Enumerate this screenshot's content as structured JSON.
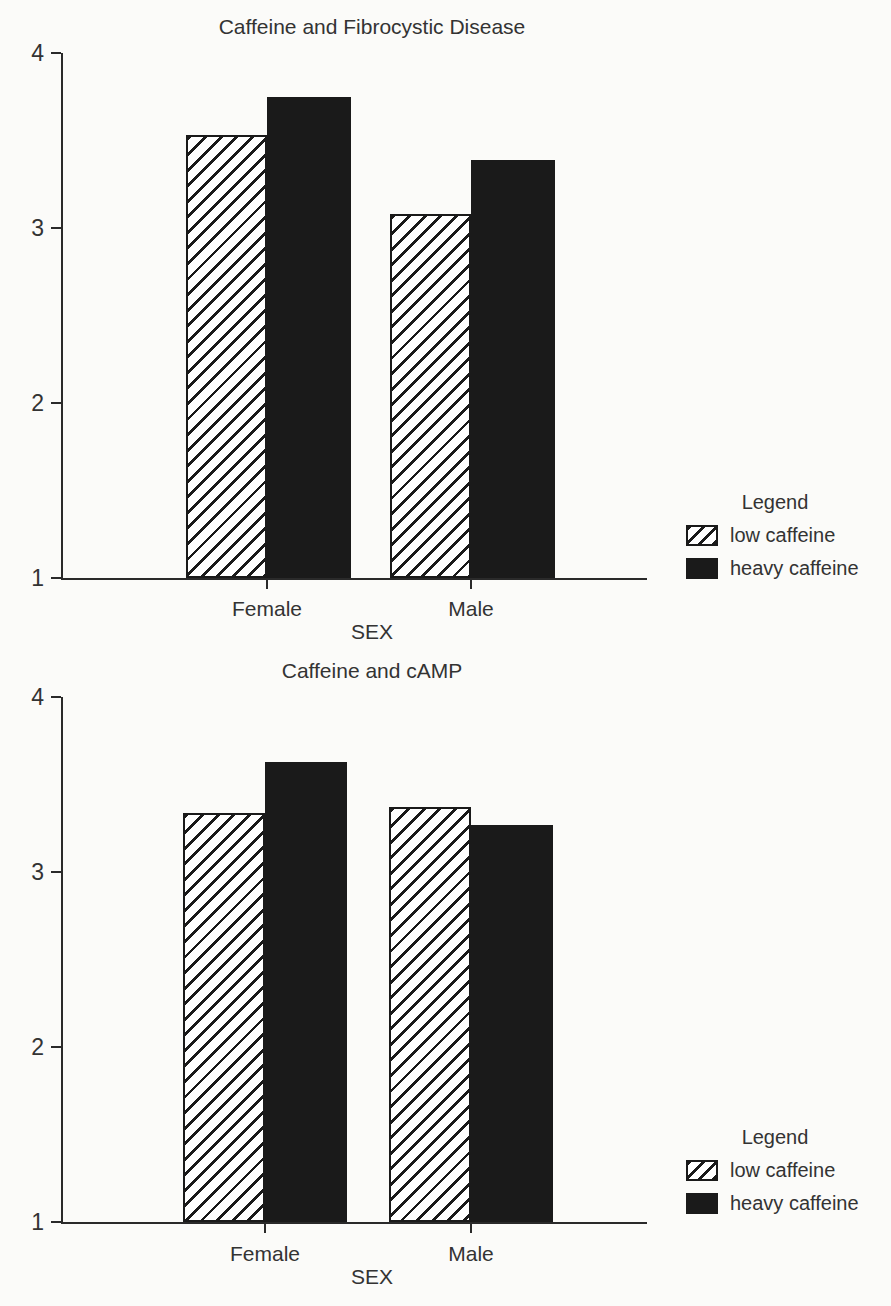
{
  "colors": {
    "background": "#fbfbf9",
    "ink": "#333333",
    "axis": "#2a2a2a",
    "bar_fill": "#1a1a1a",
    "hatch_stripe": "#1a1a1a",
    "hatch_background": "#ffffff"
  },
  "chart_data": [
    {
      "type": "bar",
      "title": "Caffeine and Fibrocystic Disease",
      "categories": [
        "Female",
        "Male"
      ],
      "series": [
        {
          "name": "low caffeine",
          "style": "hatched",
          "values": [
            3.53,
            3.08
          ]
        },
        {
          "name": "heavy caffeine",
          "style": "solid",
          "values": [
            3.75,
            3.39
          ]
        }
      ],
      "xlabel": "SEX",
      "ylabel": "",
      "ylim": [
        1,
        4
      ],
      "yticks": [
        1,
        2,
        3,
        4
      ],
      "grid": false,
      "legend_title": "Legend",
      "legend_position": "right"
    },
    {
      "type": "bar",
      "title": "Caffeine and cAMP",
      "categories": [
        "Female",
        "Male"
      ],
      "series": [
        {
          "name": "low caffeine",
          "style": "hatched",
          "values": [
            3.34,
            3.37
          ]
        },
        {
          "name": "heavy caffeine",
          "style": "solid",
          "values": [
            3.63,
            3.27
          ]
        }
      ],
      "xlabel": "SEX",
      "ylabel": "",
      "ylim": [
        1,
        4
      ],
      "yticks": [
        1,
        2,
        3,
        4
      ],
      "grid": false,
      "legend_title": "Legend",
      "legend_position": "right"
    }
  ]
}
